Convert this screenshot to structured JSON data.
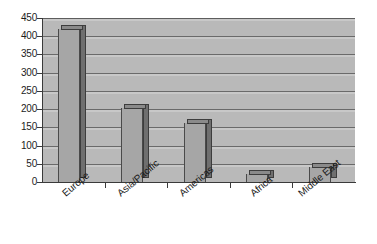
{
  "chart_data": {
    "type": "bar",
    "title": "",
    "subtitle": "",
    "xlabel": "",
    "ylabel": "",
    "categories": [
      "Europe",
      "Asia/Pacific",
      "Americas",
      "Africa",
      "Middle East"
    ],
    "values": [
      420,
      203,
      163,
      23,
      40
    ],
    "series": [
      {
        "name": "",
        "values": [
          420,
          203,
          163,
          23,
          40
        ]
      }
    ],
    "ylim": [
      0,
      450
    ],
    "y_tick_step": 50,
    "y_ticks": [
      0,
      50,
      100,
      150,
      200,
      250,
      300,
      350,
      400,
      450
    ],
    "y_tick_labels": [
      "0",
      "50",
      "100",
      "150",
      "200",
      "250",
      "300",
      "350",
      "400",
      "450"
    ],
    "grid": true,
    "grid_axis": "y",
    "legend": false,
    "legend_position": "none",
    "label_rotation": -40,
    "style": "3d-column",
    "colors": {
      "plot_background": "#b9b9b9",
      "figure_background": "#ffffff",
      "bar_front": "#a6a6a6",
      "bar_side": "#6f6f6f",
      "bar_top": "#8a8a8a",
      "bar_outline": "#3d3d3d",
      "gridline": "#6a6a6a",
      "axis": "#3a3a3a",
      "text": "#1a1a1a"
    }
  }
}
